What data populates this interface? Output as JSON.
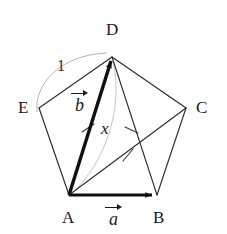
{
  "figure": {
    "background_color": "#ffffff",
    "ink_color": "#1a1a1a",
    "faint_color": "#9a9a9a",
    "width": 227,
    "height": 234
  },
  "vertices": [
    {
      "id": "A",
      "label": "A",
      "x": 69,
      "y": 195,
      "label_x": 62,
      "label_y": 210
    },
    {
      "id": "B",
      "label": "B",
      "x": 157,
      "y": 195,
      "label_x": 153,
      "label_y": 210
    },
    {
      "id": "C",
      "label": "C",
      "x": 186,
      "y": 108,
      "label_x": 196,
      "label_y": 100
    },
    {
      "id": "D",
      "label": "D",
      "x": 112,
      "y": 57,
      "label_x": 106,
      "label_y": 21
    },
    {
      "id": "E",
      "label": "E",
      "x": 39,
      "y": 108,
      "label_x": 18,
      "label_y": 100
    }
  ],
  "edges": [
    {
      "from": "A",
      "to": "B",
      "style": "bold-arrow"
    },
    {
      "from": "B",
      "to": "C",
      "style": "thin"
    },
    {
      "from": "C",
      "to": "D",
      "style": "thin"
    },
    {
      "from": "D",
      "to": "E",
      "style": "thin"
    },
    {
      "from": "E",
      "to": "A",
      "style": "thin"
    }
  ],
  "diagonals": [
    {
      "from": "A",
      "to": "D",
      "style": "bold-arrow",
      "ticks": 1
    },
    {
      "from": "D",
      "to": "B",
      "style": "thin",
      "ticks": 1
    },
    {
      "from": "A",
      "to": "C",
      "style": "thin",
      "ticks": 1
    }
  ],
  "labels": {
    "vector_a": {
      "letter": "a",
      "has_arrow": true,
      "x": 105,
      "y": 206
    },
    "vector_b": {
      "letter": "b",
      "has_arrow": true,
      "x": 71,
      "y": 92
    },
    "length_x": {
      "text": "x",
      "x": 101,
      "y": 120
    },
    "length_one": {
      "text": "1",
      "x": 57,
      "y": 58
    }
  },
  "arcs": [
    {
      "name": "side-length-arc-ED",
      "label": "1",
      "color": "#9a9a9a"
    },
    {
      "name": "diagonal-length-arc-AD",
      "label": "x",
      "color": "#b0b0b0"
    }
  ]
}
